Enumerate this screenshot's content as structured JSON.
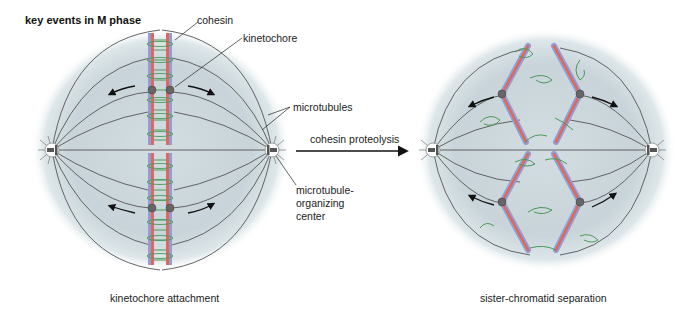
{
  "figure": {
    "title": "key events in M phase",
    "left_panel": {
      "caption": "kinetochore attachment",
      "labels": {
        "cohesin": "cohesin",
        "kinetochore": "kinetochore",
        "microtubules": "microtubules",
        "mtoc_line1": "microtubule-",
        "mtoc_line2": "organizing",
        "mtoc_line3": "center"
      }
    },
    "transition": {
      "label": "cohesin proteolysis"
    },
    "right_panel": {
      "caption": "sister-chromatid separation"
    },
    "colors": {
      "spindle_bg": "#c9d5da",
      "chromatid_red": "#e0675a",
      "chromatid_blue": "#8f9fd6",
      "cohesin_green": "#4a9a58",
      "kinetochore": "#666666",
      "microtubule": "#555555"
    }
  }
}
